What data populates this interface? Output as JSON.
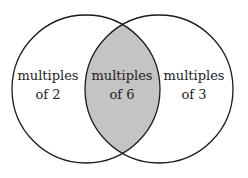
{
  "diagram": {
    "type": "venn",
    "circles": [
      {
        "id": "left",
        "cx": 86,
        "cy": 89,
        "r": 74
      },
      {
        "id": "right",
        "cx": 159,
        "cy": 89,
        "r": 74
      }
    ],
    "colors": {
      "stroke": "#1a1a1a",
      "intersection_fill": "#c4c4c4",
      "background": "#ffffff"
    },
    "regions": {
      "left": {
        "line1": "multiples",
        "line2": "of 2"
      },
      "intersection": {
        "line1": "multiples",
        "line2": "of 6"
      },
      "right": {
        "line1": "multiples",
        "line2": "of 3"
      }
    }
  }
}
